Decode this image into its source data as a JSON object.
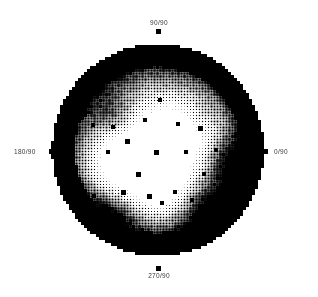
{
  "figure": {
    "type": "pole-figure",
    "title": "",
    "projection": "stereographic",
    "background_color": "#ffffff",
    "ink_color": "#000000",
    "label_color": "#3a3a3a"
  },
  "axis_labels": {
    "top": "90/90",
    "right": "0/90",
    "bottom": "270/90",
    "left": "180/90"
  },
  "ticks": {
    "top": "tick-mark-top",
    "right": "tick-mark-right",
    "bottom": "tick-mark-bottom",
    "left": "tick-mark-left"
  },
  "chart_data": {
    "type": "heatmap",
    "title": "",
    "xlabel": "",
    "ylabel": "",
    "render_style": "halftone-dot-matrix",
    "legend": "none",
    "grid": false,
    "axis_tick_labels": [
      "90/90",
      "0/90",
      "270/90",
      "180/90"
    ],
    "axis_tick_angles_deg": [
      90,
      0,
      270,
      180
    ],
    "pole_radius_label": "90",
    "circle": {
      "cx": 158,
      "cy": 150,
      "r": 106
    },
    "cell_size_px": 3,
    "dot_min_px": 0,
    "dot_max_px": 3,
    "intensity_range": [
      0.0,
      1.0
    ],
    "intensity_description": "dot area encodes pole density; large black dots = high intensity, small dots = low intensity",
    "outer_ring": {
      "inner_fraction_of_r": 0.78,
      "intensity": 1.0,
      "description": "solid black annulus at rim"
    },
    "peaks": [
      {
        "name": "core-bright-maximum",
        "cx": 150,
        "cy": 158,
        "sigma": 34,
        "amplitude": -0.82
      },
      {
        "name": "secondary-bright-upper-right",
        "cx": 196,
        "cy": 120,
        "sigma": 20,
        "amplitude": -0.42
      },
      {
        "name": "secondary-bright-left",
        "cx": 108,
        "cy": 168,
        "sigma": 22,
        "amplitude": -0.3
      },
      {
        "name": "bright-lower-center",
        "cx": 163,
        "cy": 196,
        "sigma": 18,
        "amplitude": -0.26
      },
      {
        "name": "dark-band-upper-left",
        "cx": 117,
        "cy": 118,
        "sigma": 16,
        "amplitude": 0.4
      },
      {
        "name": "dark-band-upper-right",
        "cx": 198,
        "cy": 116,
        "sigma": 13,
        "amplitude": 0.36
      },
      {
        "name": "dark-lower-left",
        "cx": 112,
        "cy": 214,
        "sigma": 20,
        "amplitude": 0.34
      },
      {
        "name": "dark-lower-right",
        "cx": 206,
        "cy": 206,
        "sigma": 22,
        "amplitude": 0.38
      },
      {
        "name": "dark-right-mid",
        "cx": 226,
        "cy": 160,
        "sigma": 17,
        "amplitude": 0.34
      }
    ],
    "speckles": [
      {
        "x": 128,
        "y": 142,
        "r": 2.6
      },
      {
        "x": 156,
        "y": 152,
        "r": 2.4
      },
      {
        "x": 186,
        "y": 152,
        "r": 2.2
      },
      {
        "x": 113,
        "y": 127,
        "r": 2.2
      },
      {
        "x": 138,
        "y": 174,
        "r": 2.3
      },
      {
        "x": 149,
        "y": 196,
        "r": 2.4
      },
      {
        "x": 175,
        "y": 192,
        "r": 2.2
      },
      {
        "x": 200,
        "y": 128,
        "r": 2.3
      },
      {
        "x": 93,
        "y": 125,
        "r": 2.1
      },
      {
        "x": 204,
        "y": 174,
        "r": 2.2
      },
      {
        "x": 123,
        "y": 192,
        "r": 2.3
      },
      {
        "x": 162,
        "y": 203,
        "r": 2.1
      },
      {
        "x": 94,
        "y": 196,
        "r": 2.0
      },
      {
        "x": 216,
        "y": 150,
        "r": 2.0
      },
      {
        "x": 145,
        "y": 120,
        "r": 2.1
      },
      {
        "x": 178,
        "y": 124,
        "r": 2.0
      },
      {
        "x": 108,
        "y": 152,
        "r": 2.0
      },
      {
        "x": 192,
        "y": 200,
        "r": 2.1
      },
      {
        "x": 135,
        "y": 239,
        "r": 2.0
      },
      {
        "x": 160,
        "y": 100,
        "r": 1.9
      }
    ]
  }
}
